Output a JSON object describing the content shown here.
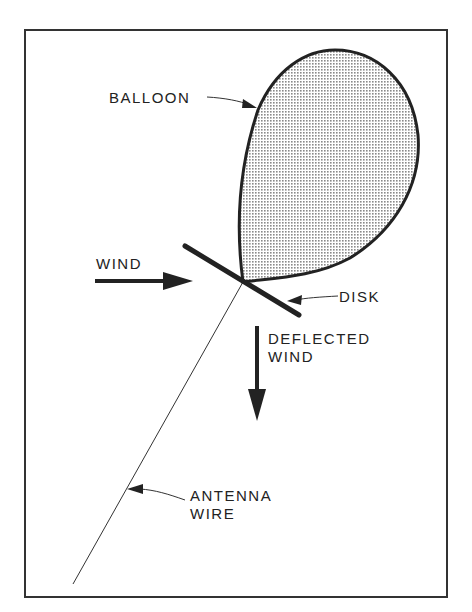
{
  "diagram": {
    "labels": {
      "balloon": "BALLOON",
      "wind": "WIND",
      "disk": "DISK",
      "deflected_line1": "DEFLECTED",
      "deflected_line2": "WIND",
      "antenna_line1": "ANTENNA",
      "antenna_line2": "WIRE"
    },
    "colors": {
      "ink": "#222222",
      "frame": "#333333",
      "background": "#ffffff"
    }
  }
}
